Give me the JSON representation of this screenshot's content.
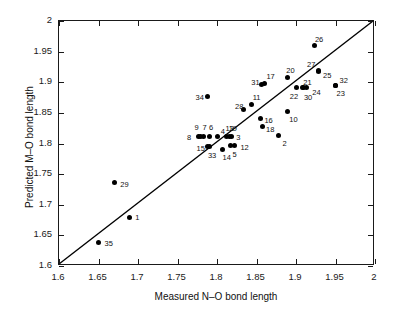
{
  "chart_data": {
    "type": "scatter",
    "title": "",
    "xlabel": "Measured N–O bond length",
    "ylabel": "Predicted M–O bond length",
    "xlim": [
      1.6,
      2.0
    ],
    "ylim": [
      1.6,
      2.0
    ],
    "grid": false,
    "legend": "none",
    "xticks": [
      "1.6",
      "1.65",
      "1.7",
      "1.75",
      "1.8",
      "1.85",
      "1.9",
      "1.95",
      "2"
    ],
    "xtick_values": [
      1.6,
      1.65,
      1.7,
      1.75,
      1.8,
      1.85,
      1.9,
      1.95,
      2.0
    ],
    "yticks": [
      "1.6",
      "1.65",
      "1.7",
      "1.75",
      "1.8",
      "1.85",
      "1.9",
      "1.95",
      "2"
    ],
    "ytick_values": [
      1.6,
      1.65,
      1.7,
      1.75,
      1.8,
      1.85,
      1.9,
      1.95,
      2.0
    ],
    "reference_line": {
      "name": "identity-line",
      "from": [
        1.6,
        1.6
      ],
      "to": [
        2.0,
        2.0
      ],
      "color": "#000000"
    },
    "marker_color": "#000000",
    "points": [
      {
        "label": "1",
        "x": 1.689,
        "y": 1.68,
        "lx": 6,
        "ly": -3
      },
      {
        "label": "2",
        "x": 1.878,
        "y": 1.813,
        "lx": 4,
        "ly": 4
      },
      {
        "label": "3",
        "x": 1.818,
        "y": 1.812,
        "lx": 5,
        "ly": -2
      },
      {
        "label": "4",
        "x": 1.801,
        "y": 1.812,
        "lx": 3,
        "ly": -8
      },
      {
        "label": "5",
        "x": 1.817,
        "y": 1.796,
        "lx": 2,
        "ly": 5
      },
      {
        "label": "6",
        "x": 1.791,
        "y": 1.812,
        "lx": -1,
        "ly": -12
      },
      {
        "label": "7",
        "x": 1.783,
        "y": 1.812,
        "lx": -1,
        "ly": -12
      },
      {
        "label": "8",
        "x": 1.776,
        "y": 1.811,
        "lx": -11,
        "ly": -3
      },
      {
        "label": "9",
        "x": 1.779,
        "y": 1.812,
        "lx": -6,
        "ly": -12
      },
      {
        "label": "10",
        "x": 1.889,
        "y": 1.853,
        "lx": 2,
        "ly": 5
      },
      {
        "label": "11",
        "x": 1.844,
        "y": 1.864,
        "lx": 1,
        "ly": -10
      },
      {
        "label": "12",
        "x": 1.822,
        "y": 1.796,
        "lx": 6,
        "ly": -2
      },
      {
        "label": "13",
        "x": 1.812,
        "y": 1.812,
        "lx": -1,
        "ly": -11
      },
      {
        "label": "14",
        "x": 1.807,
        "y": 1.791,
        "lx": 0,
        "ly": 5
      },
      {
        "label": "15",
        "x": 1.788,
        "y": 1.795,
        "lx": -11,
        "ly": -2
      },
      {
        "label": "16",
        "x": 1.855,
        "y": 1.841,
        "lx": 4,
        "ly": -1
      },
      {
        "label": "17",
        "x": 1.86,
        "y": 1.898,
        "lx": 2,
        "ly": -10
      },
      {
        "label": "18",
        "x": 1.857,
        "y": 1.827,
        "lx": 4,
        "ly": -1
      },
      {
        "label": "19",
        "x": 1.816,
        "y": 1.812,
        "lx": -1,
        "ly": -11
      },
      {
        "label": "20",
        "x": 1.889,
        "y": 1.908,
        "lx": -1,
        "ly": -10
      },
      {
        "label": "21",
        "x": 1.908,
        "y": 1.891,
        "lx": 1,
        "ly": -9
      },
      {
        "label": "22",
        "x": 1.901,
        "y": 1.891,
        "lx": -7,
        "ly": 5
      },
      {
        "label": "23",
        "x": 1.95,
        "y": 1.895,
        "lx": 1,
        "ly": 5
      },
      {
        "label": "24",
        "x": 1.913,
        "y": 1.891,
        "lx": 6,
        "ly": 1
      },
      {
        "label": "25",
        "x": 1.928,
        "y": 1.917,
        "lx": 5,
        "ly": 0
      },
      {
        "label": "26",
        "x": 1.924,
        "y": 1.96,
        "lx": 0,
        "ly": -10
      },
      {
        "label": "27",
        "x": 1.928,
        "y": 1.92,
        "lx": -11,
        "ly": -9
      },
      {
        "label": "28",
        "x": 1.833,
        "y": 1.855,
        "lx": -8,
        "ly": -7
      },
      {
        "label": "29",
        "x": 1.67,
        "y": 1.736,
        "lx": 6,
        "ly": -2
      },
      {
        "label": "30",
        "x": 1.91,
        "y": 1.891,
        "lx": 0,
        "ly": 6
      },
      {
        "label": "31",
        "x": 1.856,
        "y": 1.897,
        "lx": -10,
        "ly": -5
      },
      {
        "label": "32",
        "x": 1.95,
        "y": 1.895,
        "lx": 4,
        "ly": -8
      },
      {
        "label": "33",
        "x": 1.791,
        "y": 1.795,
        "lx": -2,
        "ly": 5
      },
      {
        "label": "34",
        "x": 1.788,
        "y": 1.877,
        "lx": -12,
        "ly": -2
      },
      {
        "label": "35",
        "x": 1.65,
        "y": 1.639,
        "lx": 6,
        "ly": -2
      }
    ]
  }
}
